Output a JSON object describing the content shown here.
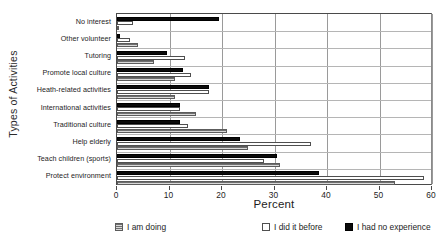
{
  "chart_data": {
    "type": "bar",
    "orientation": "horizontal",
    "title": "",
    "xlabel": "Percent",
    "ylabel": "Types of Activities",
    "xlim": [
      0,
      60
    ],
    "xticks": [
      0,
      10,
      20,
      30,
      40,
      50,
      60
    ],
    "xtick_labels": [
      "0",
      "10",
      "20",
      "30",
      "40",
      "50",
      "60"
    ],
    "grid": "vertical-and-horizontal",
    "legend_position": "bottom",
    "categories": [
      "No interest",
      "Other volunteer",
      "Tutoring",
      "Promote local culture",
      "Heath-related activities",
      "International activities",
      "Traditional culture",
      "Help elderly",
      "Teach children (sports)",
      "Protect environment"
    ],
    "series": [
      {
        "name": "I am doing",
        "swatch": "gray-hatched",
        "values": [
          0,
          4,
          7,
          11,
          11,
          15,
          21,
          25,
          31,
          53
        ]
      },
      {
        "name": "I did it before",
        "swatch": "white",
        "values": [
          3,
          2.5,
          13,
          14,
          17.5,
          12,
          13.5,
          37,
          28,
          58.5
        ]
      },
      {
        "name": "I had no experience",
        "swatch": "black",
        "values": [
          19.5,
          0.5,
          9.5,
          12.5,
          17.5,
          12,
          12,
          23.5,
          30.5,
          38.5
        ]
      }
    ]
  },
  "legend": {
    "items": [
      {
        "label": "I am doing"
      },
      {
        "label": "I did it before"
      },
      {
        "label": "I had no experience"
      }
    ]
  }
}
